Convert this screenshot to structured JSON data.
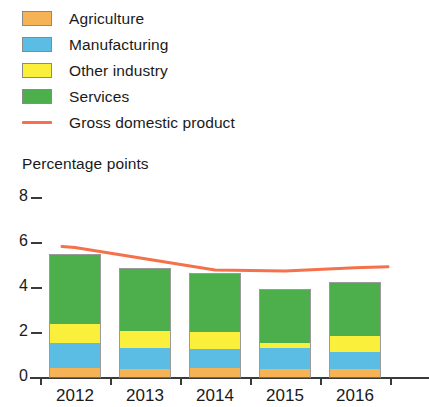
{
  "legend": {
    "items": [
      {
        "label": "Agriculture",
        "color": "#F5B356",
        "marker": "swatch"
      },
      {
        "label": "Manufacturing",
        "color": "#5BBCE4",
        "marker": "swatch"
      },
      {
        "label": "Other industry",
        "color": "#FAF03C",
        "marker": "swatch"
      },
      {
        "label": "Services",
        "color": "#4CAF4C",
        "marker": "swatch"
      },
      {
        "label": "Gross domestic product",
        "color": "#F4714B",
        "marker": "line"
      }
    ]
  },
  "axis": {
    "y_title": "Percentage points",
    "y_ticks": [
      "0",
      "2",
      "4",
      "6",
      "8"
    ],
    "x_ticks": [
      "2012",
      "2013",
      "2014",
      "2015",
      "2016"
    ]
  },
  "chart_data": {
    "type": "bar",
    "title": "",
    "subtitle": "",
    "xlabel": "",
    "ylabel": "Percentage points",
    "ylim": [
      0,
      8
    ],
    "ytick_values": [
      0,
      2,
      4,
      6,
      8
    ],
    "grid": false,
    "stacked": true,
    "legend_position": "top-left",
    "categories": [
      "2012",
      "2013",
      "2014",
      "2015",
      "2016"
    ],
    "series": [
      {
        "name": "Agriculture",
        "type": "bar",
        "color": "#F5B356",
        "values": [
          0.45,
          0.4,
          0.45,
          0.4,
          0.4
        ]
      },
      {
        "name": "Manufacturing",
        "type": "bar",
        "color": "#5BBCE4",
        "values": [
          1.1,
          0.95,
          0.85,
          0.95,
          0.75
        ]
      },
      {
        "name": "Other industry",
        "type": "bar",
        "color": "#FAF03C",
        "values": [
          0.85,
          0.75,
          0.75,
          0.2,
          0.7
        ]
      },
      {
        "name": "Services",
        "type": "bar",
        "color": "#4CAF4C",
        "values": [
          3.1,
          2.8,
          2.6,
          2.4,
          2.4
        ]
      },
      {
        "name": "Gross domestic product",
        "type": "line",
        "color": "#F4714B",
        "values": [
          5.8,
          5.3,
          4.8,
          4.75,
          4.9
        ]
      }
    ],
    "totals": [
      5.5,
      4.9,
      4.65,
      3.95,
      4.25
    ],
    "annotations": []
  }
}
